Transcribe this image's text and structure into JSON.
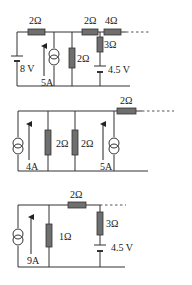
{
  "circuits": [
    {
      "id": "circuit-1",
      "components": {
        "r_left": "2Ω",
        "r_mid_top": "2Ω",
        "r_right_top": "4Ω",
        "r_shunt": "2Ω",
        "r_vertical": "3Ω",
        "battery_left": "8 V",
        "current_source": "5A",
        "battery_right": "4.5 V"
      }
    },
    {
      "id": "circuit-2",
      "components": {
        "current_source_left": "4A",
        "r_shunt_1": "2Ω",
        "r_shunt_2": "2Ω",
        "current_source_right": "5A",
        "r_top": "2Ω"
      }
    },
    {
      "id": "circuit-3",
      "components": {
        "current_source": "9A",
        "r_shunt": "1Ω",
        "r_top": "2Ω",
        "r_vertical": "3Ω",
        "battery": "4.5 V"
      }
    }
  ],
  "colors": {
    "wire": "#333333",
    "resistor_fill": "#6f6f6f",
    "background": "#ffffff"
  }
}
